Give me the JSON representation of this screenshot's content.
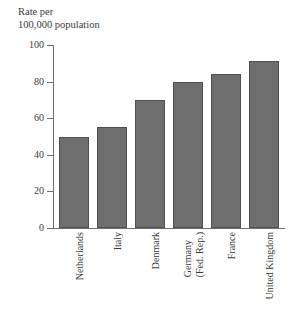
{
  "chart_data": {
    "type": "bar",
    "title": "",
    "axis_title_lines": [
      "Rate per",
      "100,000 population"
    ],
    "ylabel": "Rate per 100,000 population",
    "xlabel": "",
    "categories": [
      "Netherlands",
      "Italy",
      "Denmark",
      "Germany (Fed. Rep.)",
      "France",
      "United Kingdom"
    ],
    "category_lines": [
      [
        "Netherlands"
      ],
      [
        "Italy"
      ],
      [
        "Denmark"
      ],
      [
        "Germany",
        "(Fed. Rep.)"
      ],
      [
        "France"
      ],
      [
        "United Kingdom"
      ]
    ],
    "values": [
      50,
      55,
      70,
      80,
      84,
      91
    ],
    "ylim": [
      0,
      100
    ],
    "yticks": [
      0,
      20,
      40,
      60,
      80,
      100
    ],
    "ytick_labels": [
      "0",
      "20",
      "40",
      "60",
      "80",
      "100"
    ],
    "grid": false,
    "legend": null,
    "bar_color": "#6e6e6e",
    "bar_border_color": "#4f4f4f",
    "axis_color": "#6f6f6f",
    "text_color": "#3a3a3a",
    "background": "#ffffff"
  }
}
